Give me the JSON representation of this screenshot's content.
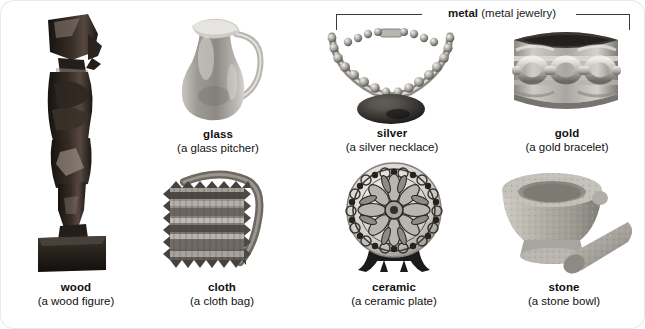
{
  "group_label": {
    "term": "metal",
    "gloss": "(metal jewelry)",
    "covers": [
      "silver",
      "gold"
    ]
  },
  "items": [
    {
      "id": "wood",
      "term": "wood",
      "gloss": "(a wood figure)",
      "icon": "wood-figure-photo"
    },
    {
      "id": "glass",
      "term": "glass",
      "gloss": "(a glass pitcher)",
      "icon": "glass-pitcher-photo"
    },
    {
      "id": "silver",
      "term": "silver",
      "gloss": "(a silver necklace)",
      "icon": "silver-necklace-photo"
    },
    {
      "id": "gold",
      "term": "gold",
      "gloss": "(a gold bracelet)",
      "icon": "gold-bracelet-photo"
    },
    {
      "id": "cloth",
      "term": "cloth",
      "gloss": "(a cloth bag)",
      "icon": "cloth-bag-photo"
    },
    {
      "id": "ceramic",
      "term": "ceramic",
      "gloss": "(a ceramic plate)",
      "icon": "ceramic-plate-photo"
    },
    {
      "id": "stone",
      "term": "stone",
      "gloss": "(a stone bowl)",
      "icon": "stone-bowl-photo"
    }
  ],
  "colors": {
    "page_background": "#ffffff",
    "text": "#111111",
    "rule": "#3a3a3a",
    "border": "#e9e9e9",
    "wood_dark": "#2b2622",
    "glass_grey": "#b6b3ae",
    "metal_grey": "#9a9893",
    "stone_grey": "#b9b7b0",
    "ceramic_grey": "#c9c6c0"
  }
}
